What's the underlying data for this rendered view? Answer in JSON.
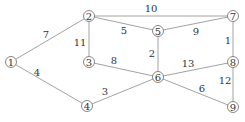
{
  "graph": {
    "nodes": [
      {
        "id": "1",
        "label": "1",
        "x": 11,
        "y": 62
      },
      {
        "id": "2",
        "label": "2",
        "x": 89,
        "y": 16
      },
      {
        "id": "3",
        "label": "3",
        "x": 89,
        "y": 62
      },
      {
        "id": "4",
        "label": "4",
        "x": 87,
        "y": 106
      },
      {
        "id": "5",
        "label": "5",
        "x": 158,
        "y": 31
      },
      {
        "id": "6",
        "label": "6",
        "x": 158,
        "y": 77
      },
      {
        "id": "7",
        "label": "7",
        "x": 233,
        "y": 16
      },
      {
        "id": "8",
        "label": "8",
        "x": 233,
        "y": 62
      },
      {
        "id": "9",
        "label": "9",
        "x": 233,
        "y": 107
      }
    ],
    "edges": [
      {
        "from": "1",
        "to": "2",
        "weight": "7",
        "lx": 46,
        "ly": 34
      },
      {
        "from": "1",
        "to": "4",
        "weight": "4",
        "lx": 37,
        "ly": 72
      },
      {
        "from": "2",
        "to": "3",
        "weight": "11",
        "lx": 80,
        "ly": 42
      },
      {
        "from": "2",
        "to": "5",
        "weight": "5",
        "lx": 124,
        "ly": 30
      },
      {
        "from": "2",
        "to": "7",
        "weight": "10",
        "lx": 151,
        "ly": 8
      },
      {
        "from": "3",
        "to": "6",
        "weight": "8",
        "lx": 114,
        "ly": 60
      },
      {
        "from": "4",
        "to": "6",
        "weight": "3",
        "lx": 105,
        "ly": 91
      },
      {
        "from": "5",
        "to": "6",
        "weight": "2",
        "lx": 152,
        "ly": 53
      },
      {
        "from": "5",
        "to": "7",
        "weight": "9",
        "lx": 196,
        "ly": 31
      },
      {
        "from": "6",
        "to": "8",
        "weight": "13",
        "lx": 188,
        "ly": 63
      },
      {
        "from": "6",
        "to": "9",
        "weight": "6",
        "lx": 202,
        "ly": 88
      },
      {
        "from": "7",
        "to": "8",
        "weight": "1",
        "lx": 228,
        "ly": 40
      },
      {
        "from": "8",
        "to": "9",
        "weight": "12",
        "lx": 225,
        "ly": 80
      }
    ]
  }
}
